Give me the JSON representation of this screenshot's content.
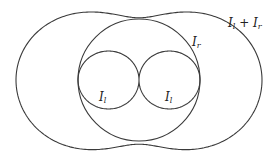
{
  "diagram": {
    "type": "polar-intensity-pattern",
    "center": [
      139,
      80
    ],
    "curves": [
      {
        "id": "outer",
        "name": "sum",
        "label_main": "I",
        "label_sub": "l",
        "label_op": " + ",
        "label_main2": "I",
        "label_sub2": "r"
      },
      {
        "id": "circle",
        "name": "I_r",
        "label_main": "I",
        "label_sub": "r"
      },
      {
        "id": "figure8",
        "name": "I_l",
        "label_main": "I",
        "label_sub": "l"
      }
    ],
    "labels": {
      "sum": {
        "main": "I",
        "sub": "l",
        "op": " + ",
        "main2": "I",
        "sub2": "r"
      },
      "circle": {
        "main": "I",
        "sub": "r"
      },
      "lobe_left": {
        "main": "I",
        "sub": "l"
      },
      "lobe_right": {
        "main": "I",
        "sub": "l"
      }
    },
    "stroke_color": "#3a3a3a",
    "background": "#ffffff"
  }
}
